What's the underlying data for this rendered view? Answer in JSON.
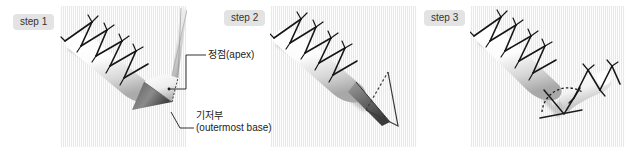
{
  "figure": {
    "background": "#ffffff",
    "panel_background": "#f2f2f2",
    "ink_color": "#1b1b1b",
    "shade_color": "#6e6e6e",
    "chip_background": "#e3e3e3",
    "width": 635,
    "height": 153
  },
  "steps": [
    {
      "id": "step-1",
      "label": "step 1",
      "illustration": "sutured-tissue-roll-with-needle-forming-conical-apex"
    },
    {
      "id": "step-2",
      "label": "step 2",
      "illustration": "sutured-tissue-roll-with-triangular-outline-at-end"
    },
    {
      "id": "step-3",
      "label": "step 3",
      "illustration": "folded-v-shaped-sutured-tissue-roll-with-dashed-arc"
    }
  ],
  "annotations": [
    {
      "id": "apex",
      "text": "정점(apex)",
      "line1": "정점(apex)",
      "line2": "",
      "points_to": "cone-tip-in-step-1"
    },
    {
      "id": "base",
      "text": "기저부 (outermost base)",
      "line1": "기저부",
      "line2": "(outermost base)",
      "points_to": "cone-base-in-step-1"
    }
  ]
}
